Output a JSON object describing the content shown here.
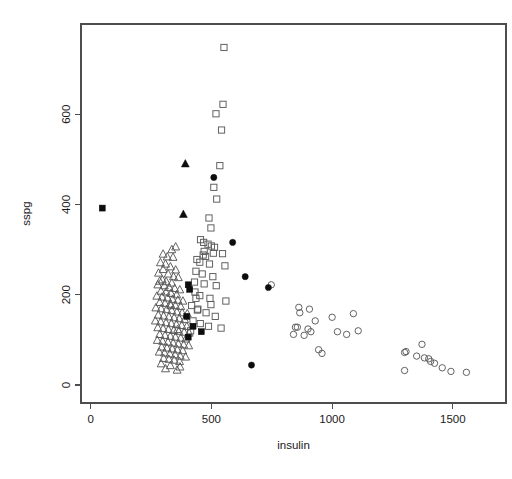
{
  "chart_data": {
    "type": "scatter",
    "title": "",
    "xlabel": "insulin",
    "ylabel": "sspg",
    "xlim": [
      -40,
      1720
    ],
    "ylim": [
      -40,
      800
    ],
    "xticks": [
      0,
      500,
      1000,
      1500
    ],
    "yticks": [
      0,
      200,
      400,
      600
    ],
    "xtick_labels": [
      "0",
      "500",
      "1000",
      "1500"
    ],
    "ytick_labels": [
      "0",
      "200",
      "400",
      "600"
    ],
    "grid": false,
    "legend": "none",
    "series": [
      {
        "name": "open-triangle",
        "marker": "triangle-open",
        "color": "#5a5a5a",
        "points": [
          [
            352,
            306
          ],
          [
            336,
            300
          ],
          [
            300,
            290
          ],
          [
            317,
            284
          ],
          [
            341,
            283
          ],
          [
            289,
            271
          ],
          [
            310,
            268
          ],
          [
            330,
            262
          ],
          [
            300,
            256
          ],
          [
            352,
            255
          ],
          [
            281,
            248
          ],
          [
            321,
            246
          ],
          [
            343,
            240
          ],
          [
            363,
            238
          ],
          [
            297,
            233
          ],
          [
            313,
            229
          ],
          [
            336,
            226
          ],
          [
            278,
            222
          ],
          [
            305,
            220
          ],
          [
            325,
            216
          ],
          [
            348,
            214
          ],
          [
            369,
            211
          ],
          [
            291,
            208
          ],
          [
            312,
            206
          ],
          [
            333,
            203
          ],
          [
            356,
            200
          ],
          [
            274,
            197
          ],
          [
            296,
            195
          ],
          [
            318,
            193
          ],
          [
            339,
            190
          ],
          [
            361,
            188
          ],
          [
            382,
            186
          ],
          [
            286,
            183
          ],
          [
            308,
            181
          ],
          [
            330,
            179
          ],
          [
            351,
            176
          ],
          [
            373,
            174
          ],
          [
            270,
            171
          ],
          [
            292,
            169
          ],
          [
            314,
            167
          ],
          [
            336,
            165
          ],
          [
            357,
            162
          ],
          [
            379,
            160
          ],
          [
            400,
            158
          ],
          [
            280,
            155
          ],
          [
            302,
            153
          ],
          [
            324,
            151
          ],
          [
            346,
            149
          ],
          [
            367,
            147
          ],
          [
            389,
            145
          ],
          [
            268,
            142
          ],
          [
            290,
            140
          ],
          [
            312,
            138
          ],
          [
            334,
            136
          ],
          [
            355,
            134
          ],
          [
            377,
            132
          ],
          [
            398,
            130
          ],
          [
            278,
            127
          ],
          [
            300,
            125
          ],
          [
            322,
            123
          ],
          [
            344,
            121
          ],
          [
            365,
            119
          ],
          [
            387,
            117
          ],
          [
            408,
            115
          ],
          [
            286,
            112
          ],
          [
            308,
            110
          ],
          [
            330,
            108
          ],
          [
            351,
            106
          ],
          [
            373,
            104
          ],
          [
            394,
            102
          ],
          [
            276,
            99
          ],
          [
            298,
            97
          ],
          [
            320,
            95
          ],
          [
            342,
            93
          ],
          [
            363,
            91
          ],
          [
            385,
            89
          ],
          [
            406,
            87
          ],
          [
            294,
            84
          ],
          [
            316,
            82
          ],
          [
            338,
            80
          ],
          [
            359,
            78
          ],
          [
            381,
            76
          ],
          [
            284,
            73
          ],
          [
            306,
            71
          ],
          [
            328,
            69
          ],
          [
            350,
            67
          ],
          [
            371,
            64
          ],
          [
            393,
            62
          ],
          [
            302,
            59
          ],
          [
            324,
            57
          ],
          [
            346,
            55
          ],
          [
            368,
            52
          ],
          [
            292,
            47
          ],
          [
            330,
            43
          ],
          [
            370,
            40
          ],
          [
            310,
            36
          ],
          [
            358,
            33
          ],
          [
            286,
            230
          ],
          [
            332,
            176
          ],
          [
            360,
            123
          ]
        ]
      },
      {
        "name": "open-square",
        "marker": "square-open",
        "color": "#5a5a5a",
        "points": [
          [
            552,
            748
          ],
          [
            548,
            622
          ],
          [
            519,
            601
          ],
          [
            542,
            565
          ],
          [
            535,
            486
          ],
          [
            510,
            438
          ],
          [
            522,
            412
          ],
          [
            490,
            370
          ],
          [
            498,
            348
          ],
          [
            455,
            322
          ],
          [
            468,
            316
          ],
          [
            486,
            312
          ],
          [
            500,
            308
          ],
          [
            513,
            305
          ],
          [
            470,
            296
          ],
          [
            466,
            288
          ],
          [
            476,
            285
          ],
          [
            508,
            292
          ],
          [
            546,
            291
          ],
          [
            440,
            278
          ],
          [
            452,
            272
          ],
          [
            492,
            268
          ],
          [
            556,
            264
          ],
          [
            436,
            252
          ],
          [
            462,
            246
          ],
          [
            506,
            240
          ],
          [
            430,
            228
          ],
          [
            470,
            224
          ],
          [
            520,
            220
          ],
          [
            432,
            206
          ],
          [
            452,
            198
          ],
          [
            494,
            192
          ],
          [
            560,
            186
          ],
          [
            418,
            176
          ],
          [
            444,
            168
          ],
          [
            478,
            160
          ],
          [
            516,
            152
          ],
          [
            424,
            142
          ],
          [
            454,
            136
          ],
          [
            488,
            130
          ],
          [
            540,
            126
          ],
          [
            414,
            120
          ],
          [
            442,
            166
          ],
          [
            498,
            178
          ],
          [
            436,
            192
          ]
        ]
      },
      {
        "name": "open-circle",
        "marker": "circle-open",
        "color": "#5a5a5a",
        "points": [
          [
            748,
            222
          ],
          [
            862,
            172
          ],
          [
            866,
            160
          ],
          [
            906,
            168
          ],
          [
            930,
            142
          ],
          [
            848,
            128
          ],
          [
            856,
            128
          ],
          [
            900,
            124
          ],
          [
            912,
            118
          ],
          [
            840,
            112
          ],
          [
            884,
            110
          ],
          [
            1000,
            150
          ],
          [
            1088,
            158
          ],
          [
            1022,
            118
          ],
          [
            1060,
            112
          ],
          [
            1108,
            120
          ],
          [
            944,
            78
          ],
          [
            958,
            70
          ],
          [
            1300,
            72
          ],
          [
            1306,
            74
          ],
          [
            1350,
            64
          ],
          [
            1372,
            90
          ],
          [
            1400,
            58
          ],
          [
            1408,
            52
          ],
          [
            1424,
            48
          ],
          [
            1300,
            32
          ],
          [
            1456,
            38
          ],
          [
            1492,
            30
          ],
          [
            1556,
            28
          ],
          [
            1382,
            60
          ]
        ]
      },
      {
        "name": "filled-square",
        "marker": "square-filled",
        "color": "#0d0d0d",
        "points": [
          [
            48,
            392
          ],
          [
            404,
            222
          ],
          [
            410,
            212
          ],
          [
            398,
            152
          ],
          [
            424,
            130
          ],
          [
            458,
            118
          ],
          [
            404,
            106
          ]
        ]
      },
      {
        "name": "filled-triangle",
        "marker": "triangle-filled",
        "color": "#0d0d0d",
        "points": [
          [
            392,
            490
          ],
          [
            384,
            378
          ]
        ]
      },
      {
        "name": "filled-circle",
        "marker": "circle-filled",
        "color": "#0d0d0d",
        "points": [
          [
            510,
            460
          ],
          [
            588,
            316
          ],
          [
            640,
            240
          ],
          [
            736,
            216
          ],
          [
            666,
            44
          ]
        ]
      }
    ]
  }
}
